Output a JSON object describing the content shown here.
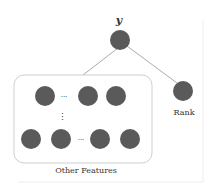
{
  "diagram": {
    "target": {
      "label": "y"
    },
    "rank": {
      "label": "Rank"
    },
    "features_group": {
      "label": "Other Features"
    },
    "ellipsis_h": "···",
    "ellipsis_v": "⋮",
    "colors": {
      "node": "#5a5a5a",
      "edge": "#aaaaaa",
      "box": "#cfcfcf",
      "text": "#333333"
    }
  }
}
